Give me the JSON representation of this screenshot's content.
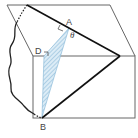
{
  "diagram": {
    "type": "3d-geometry",
    "labels": {
      "A": "A",
      "B": "B",
      "D": "D",
      "theta": "θ"
    },
    "colors": {
      "edge": "#555555",
      "thick_line": "#111111",
      "hatch": "#7fb3d5",
      "hatch_fill": "#dcecf6"
    }
  }
}
